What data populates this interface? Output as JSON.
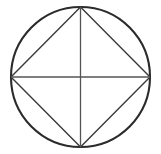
{
  "figure": {
    "title": "Circle with inscribed square and diameters",
    "background_color": "#ffffff",
    "canvas": {
      "width": 161,
      "height": 154
    },
    "center": {
      "x": 80.5,
      "y": 77
    },
    "radius": {
      "x": 69.5,
      "y": 70
    },
    "elements": {
      "circle": {
        "name": "circumscribed-circle",
        "color": "#2b2b2b",
        "stroke_width": 2.1,
        "cx": 80.5,
        "cy": 77,
        "rx": 69.5,
        "ry": 70
      },
      "square": {
        "name": "inscribed-square",
        "color": "#3a3a3a",
        "stroke_width": 1.4,
        "points": "80.5,7 150,77 80.5,147 11,77",
        "vertices": [
          {
            "label": "top",
            "x": 80.5,
            "y": 7
          },
          {
            "label": "right",
            "x": 150,
            "y": 77
          },
          {
            "label": "bottom",
            "x": 80.5,
            "y": 147
          },
          {
            "label": "left",
            "x": 11,
            "y": 77
          }
        ]
      },
      "horizontal_diameter": {
        "name": "horizontal-diameter",
        "color": "#555555",
        "stroke_width": 1.3,
        "x1": 11,
        "y1": 77,
        "x2": 150,
        "y2": 77
      },
      "vertical_diameter": {
        "name": "vertical-diameter",
        "color": "#555555",
        "stroke_width": 1.3,
        "x1": 80.5,
        "y1": 7,
        "x2": 80.5,
        "y2": 147
      }
    }
  }
}
